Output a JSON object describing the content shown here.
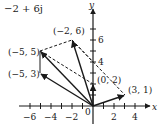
{
  "title": "−2 + 6j",
  "axes": {
    "x_label": "x",
    "y_label": "y",
    "x_ticks": [
      {
        "value": -6,
        "label": "−6"
      },
      {
        "value": -4,
        "label": "−4"
      },
      {
        "value": -2,
        "label": "−2"
      },
      {
        "value": 2,
        "label": "2"
      },
      {
        "value": 4,
        "label": "4"
      }
    ],
    "y_ticks": [
      {
        "value": 4,
        "label": "4"
      },
      {
        "value": 6,
        "label": "6"
      }
    ],
    "origin_label": "0"
  },
  "points": [
    {
      "name": "p1",
      "label": "(3, 1)",
      "x": 3,
      "y": 1
    },
    {
      "name": "p2",
      "label": "(0, 2)",
      "x": 0,
      "y": 2
    },
    {
      "name": "p3",
      "label": "(−2, 6)",
      "x": -2,
      "y": 6
    },
    {
      "name": "p4",
      "label": "(−5, 5)",
      "x": -5,
      "y": 5
    },
    {
      "name": "p5",
      "label": "(−5, 3)",
      "x": -5,
      "y": 3
    }
  ],
  "colors": {
    "ink": "#1a1a1a",
    "background": "#ffffff"
  }
}
